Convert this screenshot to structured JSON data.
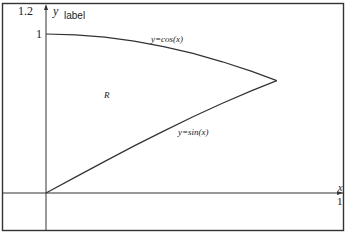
{
  "chart_data": {
    "type": "line",
    "title": "",
    "xlabel": "x",
    "ylabel": "y",
    "ylabel_extra": "label",
    "xlim": [
      0,
      1
    ],
    "ylim": [
      0,
      1.2
    ],
    "x_ticks": [
      "1"
    ],
    "y_ticks": [
      "1",
      "1.2"
    ],
    "grid": false,
    "series": [
      {
        "name": "y=cos(x)",
        "x": [
          0,
          0.1,
          0.2,
          0.3,
          0.4,
          0.5,
          0.6,
          0.7,
          0.785
        ],
        "values": [
          1,
          0.995,
          0.98,
          0.955,
          0.921,
          0.878,
          0.825,
          0.765,
          0.707
        ]
      },
      {
        "name": "y=sin(x)",
        "x": [
          0,
          0.1,
          0.2,
          0.3,
          0.4,
          0.5,
          0.6,
          0.7,
          0.785
        ],
        "values": [
          0,
          0.0998,
          0.199,
          0.296,
          0.389,
          0.479,
          0.565,
          0.644,
          0.707
        ]
      }
    ],
    "annotations": [
      {
        "text": "R",
        "x": 0.21,
        "y": 0.62
      },
      {
        "text": "y=cos(x)",
        "x": 0.38,
        "y": 0.95
      },
      {
        "text": "y=sin(x)",
        "x": 0.44,
        "y": 0.36
      }
    ],
    "intersection": {
      "x": 0.785,
      "y": 0.707
    }
  },
  "labels": {
    "y_top": "1.2",
    "y_one": "1",
    "y_axis": "y",
    "y_axis_extra": "label",
    "x_axis": "x",
    "x_one": "1",
    "region": "R",
    "cos_label": "y=cos(x)",
    "sin_label": "y=sin(x)"
  }
}
